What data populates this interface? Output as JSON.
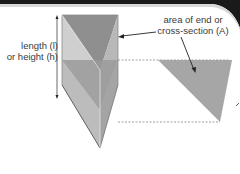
{
  "diagram": {
    "labels": {
      "length_line1": "length (l)",
      "length_line2": "or height (h)",
      "area_line1": "area of end or",
      "area_line2": "cross-section (A)"
    },
    "colors": {
      "top_face": "#8f8f8f",
      "front_face": "#c9c9c9",
      "side_face": "#a9a9a9",
      "cross_section_band": "#9a9a9a",
      "cross_section_triangle": "#a6a6a6",
      "border": "#1a1a1a",
      "text": "#3a3a3a"
    }
  }
}
